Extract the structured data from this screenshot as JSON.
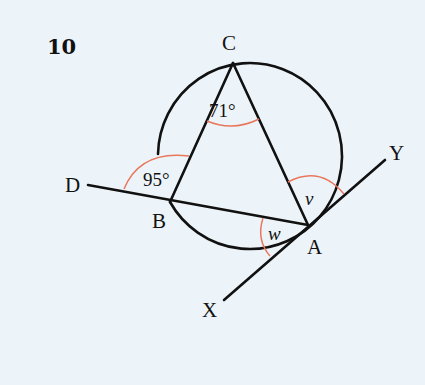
{
  "question_number": "10",
  "points": {
    "A": "A",
    "B": "B",
    "C": "C",
    "D": "D",
    "X": "X",
    "Y": "Y"
  },
  "angles": {
    "BCA": "71°",
    "DBC": "95°",
    "v": "v",
    "w": "w"
  },
  "colors": {
    "background": "#edf4f9",
    "line": "#111111",
    "angle_arc": "#e8775c"
  }
}
